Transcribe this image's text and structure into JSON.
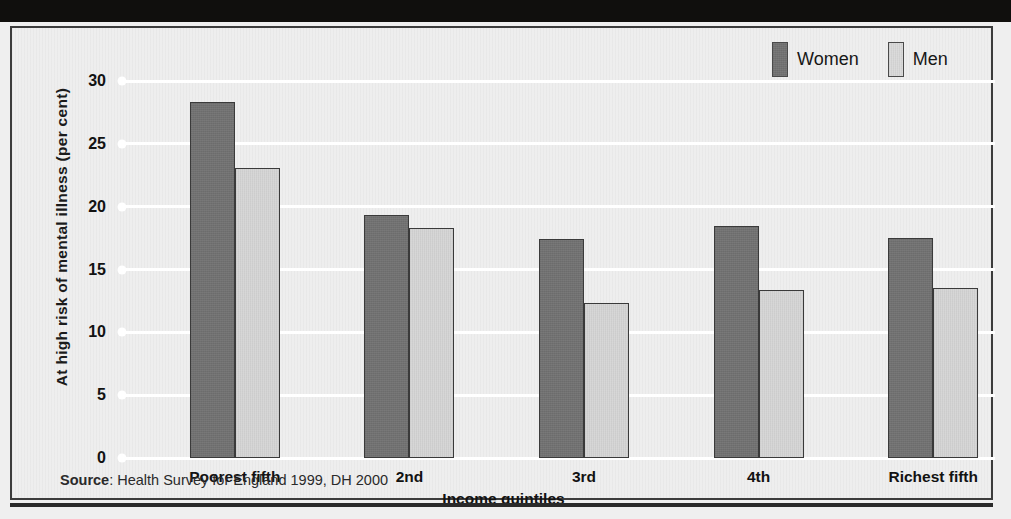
{
  "figure": {
    "title_band_text": "",
    "source_prefix": "Source",
    "source_text": ": Health Survey for England 1999, DH 2000"
  },
  "legend": {
    "position": "top-right",
    "items": [
      {
        "label": "Women",
        "color": "#717171",
        "icon": "legend-swatch-icon"
      },
      {
        "label": "Men",
        "color": "#d9d9d9",
        "icon": "legend-swatch-icon"
      }
    ]
  },
  "chart_data": {
    "type": "bar",
    "title": "",
    "xlabel": "Income quintiles",
    "ylabel": "At high risk of mental illness (per cent)",
    "categories": [
      "Poorest fifth",
      "2nd",
      "3rd",
      "4th",
      "Richest fifth"
    ],
    "series": [
      {
        "name": "Women",
        "color": "#717171",
        "values": [
          28.3,
          19.3,
          17.4,
          18.5,
          17.5
        ]
      },
      {
        "name": "Men",
        "color": "#d5d5d5",
        "values": [
          23.1,
          18.3,
          12.3,
          13.4,
          13.5
        ]
      }
    ],
    "ylim": [
      0,
      30
    ],
    "ytick_values": [
      0,
      5,
      10,
      15,
      20,
      25,
      30
    ],
    "ytick_labels": [
      "0",
      "5",
      "10",
      "15",
      "20",
      "25",
      "30"
    ],
    "grid": true,
    "grid_color": "#ffffff",
    "legend_position": "top-right",
    "source": "Source: Health Survey for England 1999, DH 2000"
  }
}
